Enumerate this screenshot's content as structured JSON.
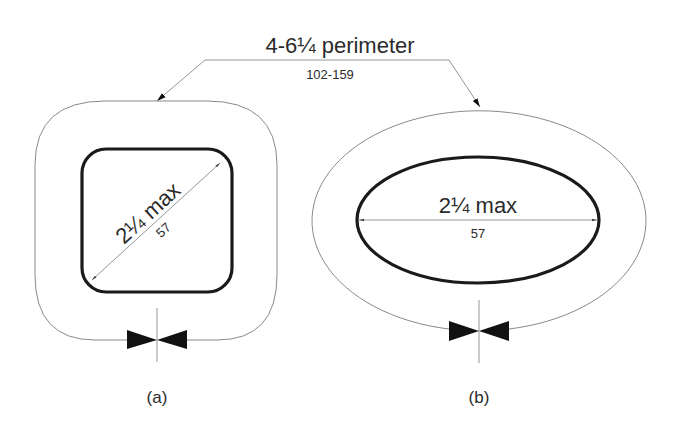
{
  "diagram": {
    "perimeter_label": {
      "imperial": "4-6¼ perimeter",
      "metric": "102-159"
    },
    "figure_a": {
      "shape": "rounded-square",
      "dimension_imperial": "2¼ max",
      "dimension_metric": "57",
      "caption": "(a)"
    },
    "figure_b": {
      "shape": "ellipse",
      "dimension_imperial": "2¼ max",
      "dimension_metric": "57",
      "caption": "(b)"
    },
    "colors": {
      "thin_line": "#8a8a8a",
      "thick_outline": "#1a1a1a",
      "text": "#2b2b2b"
    }
  }
}
